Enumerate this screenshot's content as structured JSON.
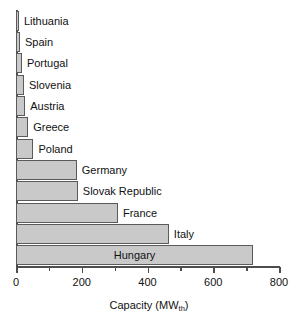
{
  "chart_data": {
    "type": "bar",
    "orientation": "horizontal",
    "title": "",
    "subtitle": "",
    "xlabel": "Capacity (MW",
    "xlabel_sub": "th",
    "xlabel_suffix": ")",
    "ylabel": "",
    "categories": [
      "Lithuania",
      "Spain",
      "Portugal",
      "Slovenia",
      "Austria",
      "Greece",
      "Poland",
      "Germany",
      "Slovak Republic",
      "France",
      "Italy",
      "Hungary"
    ],
    "values": [
      8,
      12,
      18,
      24,
      28,
      37,
      53,
      185,
      188,
      310,
      465,
      721
    ],
    "xlim": [
      0,
      800
    ],
    "ylim": [
      0,
      12
    ],
    "xticks": [
      0,
      200,
      400,
      600,
      800
    ],
    "xtick_labels": [
      "0",
      "200",
      "400",
      "600",
      "800"
    ],
    "xticks_minor": [
      100,
      300,
      500,
      700
    ],
    "grid": false,
    "legend": false,
    "legend_position": "none",
    "bar_fill_color": "#c9c9c9",
    "bar_edge_color": "#5a5a5a",
    "axis_color": "#4d4d4d",
    "text_color": "#111111",
    "background_color": "#ffffff",
    "label_placement": [
      "outside",
      "outside",
      "outside",
      "outside",
      "outside",
      "outside",
      "outside",
      "outside",
      "outside",
      "outside",
      "outside",
      "inside"
    ]
  }
}
